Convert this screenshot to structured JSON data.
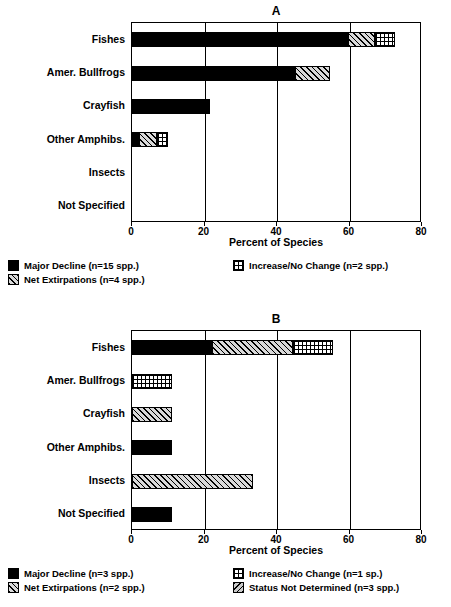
{
  "chart_data": [
    {
      "id": "A",
      "type": "bar",
      "orientation": "horizontal",
      "title": "A",
      "xlabel": "Percent of Species",
      "ylabel": "",
      "xlim": [
        0,
        80
      ],
      "xticks": [
        0,
        20,
        40,
        60,
        80
      ],
      "grid": true,
      "stacked": true,
      "categories": [
        "Fishes",
        "Amer. Bullfrogs",
        "Crayfish",
        "Other Amphibs.",
        "Insects",
        "Not Specified"
      ],
      "series": [
        {
          "name": "Major Decline (n=15 spp.)",
          "fill": "solid",
          "values": [
            59.5,
            45.0,
            21.5,
            2.0,
            0,
            0
          ]
        },
        {
          "name": "Net Extirpations (n=4 spp.)",
          "fill": "diagonal-hatch",
          "values": [
            7.5,
            9.5,
            0,
            5.0,
            0,
            0
          ]
        },
        {
          "name": "Increase/No Change (n=2 spp.)",
          "fill": "checkered",
          "values": [
            5.5,
            0,
            0,
            3.0,
            0,
            0
          ]
        }
      ],
      "totals": [
        72.5,
        54.5,
        21.5,
        10.0,
        0,
        0
      ],
      "legend": {
        "position": "below",
        "entries": [
          {
            "label": "Major Decline (n=15 spp.)",
            "fill": "solid"
          },
          {
            "label": "Increase/No Change (n=2 spp.)",
            "fill": "checkered"
          },
          {
            "label": "Net Extirpations (n=4 spp.)",
            "fill": "diagonal-hatch"
          }
        ]
      }
    },
    {
      "id": "B",
      "type": "bar",
      "orientation": "horizontal",
      "title": "B",
      "xlabel": "Percent of Species",
      "ylabel": "",
      "xlim": [
        0,
        80
      ],
      "xticks": [
        0,
        20,
        40,
        60,
        80
      ],
      "grid": true,
      "stacked": true,
      "categories": [
        "Fishes",
        "Amer. Bullfrogs",
        "Crayfish",
        "Other Amphibs.",
        "Insects",
        "Not Specified"
      ],
      "series": [
        {
          "name": "Major Decline (n=3 spp.)",
          "fill": "solid",
          "values": [
            22.0,
            0,
            0,
            11.0,
            0,
            11.0
          ]
        },
        {
          "name": "Net Extirpations (n=2 spp.)",
          "fill": "diagonal-hatch",
          "values": [
            22.5,
            0,
            11.0,
            0,
            33.5,
            0
          ]
        },
        {
          "name": "Increase/No Change (n=1 sp.)",
          "fill": "checkered",
          "values": [
            11.0,
            11.0,
            0,
            0,
            0,
            0
          ]
        },
        {
          "name": "Status Not Determined (n=3 spp.)",
          "fill": "diagonal-hatch-2",
          "values": [
            0,
            0,
            0,
            0,
            0,
            0
          ]
        }
      ],
      "totals": [
        55.5,
        11.0,
        11.0,
        11.0,
        33.5,
        11.0
      ],
      "legend": {
        "position": "below",
        "entries": [
          {
            "label": "Major Decline (n=3 spp.)",
            "fill": "solid"
          },
          {
            "label": "Increase/No Change (n=1 sp.)",
            "fill": "checkered"
          },
          {
            "label": "Net Extirpations (n=2 spp.)",
            "fill": "diagonal-hatch"
          },
          {
            "label": "Status Not Determined (n=3 spp.)",
            "fill": "diagonal-hatch-2"
          }
        ]
      }
    }
  ],
  "panelA": {
    "letter": "A",
    "xaxis_title": "Percent of Species",
    "xticklabels": [
      "0",
      "20",
      "40",
      "60",
      "80"
    ],
    "categories": [
      "Fishes",
      "Amer. Bullfrogs",
      "Crayfish",
      "Other Amphibs.",
      "Insects",
      "Not Specified"
    ],
    "legend": [
      "Major Decline (n=15 spp.)",
      "Increase/No Change (n=2 spp.)",
      "Net Extirpations (n=4 spp.)"
    ]
  },
  "panelB": {
    "letter": "B",
    "xaxis_title": "Percent of Species",
    "xticklabels": [
      "0",
      "20",
      "40",
      "60",
      "80"
    ],
    "categories": [
      "Fishes",
      "Amer. Bullfrogs",
      "Crayfish",
      "Other Amphibs.",
      "Insects",
      "Not Specified"
    ],
    "legend": [
      "Major Decline (n=3 spp.)",
      "Increase/No Change (n=1 sp.)",
      "Net Extirpations (n=2 spp.)",
      "Status Not Determined (n=3 spp.)"
    ]
  }
}
